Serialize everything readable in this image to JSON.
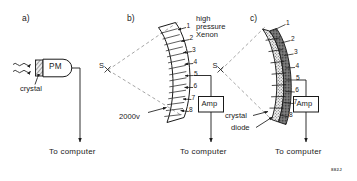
{
  "figure": {
    "id_code": "882J",
    "panels": [
      {
        "key": "a",
        "label": "a)",
        "detector_type": "scintillation-crystal-photomultiplier",
        "parts": [
          {
            "name": "crystal",
            "label": "crystal"
          },
          {
            "name": "photomultiplier",
            "label": "PM"
          }
        ],
        "output_label": "To computer",
        "incoming_rays": 2
      },
      {
        "key": "b",
        "label": "b)",
        "detector_type": "high-pressure-xenon-ionization-chamber",
        "source_marker": "S",
        "gas_label_lines": [
          "high",
          "pressure",
          "Xenon"
        ],
        "gas_label": "high pressure Xenon",
        "bias_label": "2000v",
        "amplifier_label": "Amp",
        "output_label": "To computer",
        "channels": [
          "1",
          "2",
          "3",
          "4",
          "5",
          "6",
          "7",
          "8"
        ],
        "channel_count": 8,
        "readout_channel": "5"
      },
      {
        "key": "c",
        "label": "c)",
        "detector_type": "solid-state-crystal-photodiode-array",
        "source_marker": "S",
        "parts": [
          {
            "name": "crystal",
            "label": "crystal"
          },
          {
            "name": "diode",
            "label": "diode"
          }
        ],
        "amplifier_label": "Amp",
        "output_label": "To computer",
        "channels": [
          "1",
          "2",
          "3",
          "4",
          "5",
          "6",
          "7",
          "8"
        ],
        "channel_count": 8,
        "readout_channel": "5"
      }
    ]
  },
  "colors": {
    "ink": "#1a1a1a",
    "paper": "#ffffff",
    "dashed_beam": "#8a8a8a",
    "crystal_fill": "#e8e8e8",
    "diode_fill": "#6e6e6e",
    "gas_fill": "#f2f2f2",
    "septum": "#b8b8b8"
  }
}
